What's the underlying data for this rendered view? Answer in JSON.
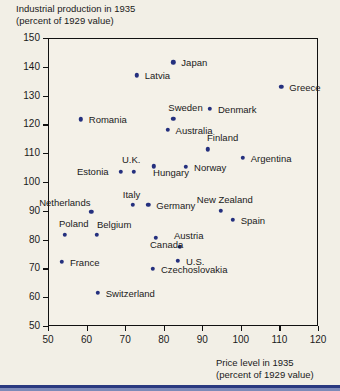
{
  "chart_data": {
    "type": "scatter",
    "title": "Industrial production in 1935\n(percent of 1929 value)",
    "ylabel": "Industrial production in 1935 (percent of 1929 value)",
    "xlabel": "Price level in 1935\n(percent of 1929 value)",
    "xlabel_line1": "Price level in 1935",
    "xlabel_line2": "(percent of 1929 value)",
    "title_line1": "Industrial production in 1935",
    "title_line2": "(percent of 1929 value)",
    "xlim": [
      50,
      120
    ],
    "ylim": [
      50,
      150
    ],
    "xticks": [
      50,
      60,
      70,
      80,
      90,
      100,
      110,
      120
    ],
    "yticks": [
      50,
      60,
      70,
      80,
      90,
      100,
      110,
      120,
      130,
      140,
      150
    ],
    "grid": false,
    "legend": "none",
    "point_color": "#24307e",
    "points": [
      {
        "label": "Japan",
        "x": 82.5,
        "y": 141.5,
        "lx": 8,
        "ly": -4
      },
      {
        "label": "Latvia",
        "x": 73.0,
        "y": 137.0,
        "lx": 8,
        "ly": -4
      },
      {
        "label": "Greece",
        "x": 110.5,
        "y": 133.0,
        "lx": 8,
        "ly": -4
      },
      {
        "label": "Denmark",
        "x": 92.0,
        "y": 125.5,
        "lx": 8,
        "ly": -4
      },
      {
        "label": "Sweden",
        "x": 82.5,
        "y": 122.0,
        "lx": -5,
        "ly": -16
      },
      {
        "label": "Romania",
        "x": 58.5,
        "y": 121.8,
        "lx": 8,
        "ly": -4
      },
      {
        "label": "Australia",
        "x": 81.0,
        "y": 118.2,
        "lx": 8,
        "ly": -4
      },
      {
        "label": "Finland",
        "x": 91.5,
        "y": 111.3,
        "lx": -1,
        "ly": -16
      },
      {
        "label": "Argentina",
        "x": 100.5,
        "y": 108.5,
        "lx": 8,
        "ly": -4
      },
      {
        "label": "Norway",
        "x": 85.8,
        "y": 105.2,
        "lx": 8,
        "ly": -4
      },
      {
        "label": "Hungary",
        "x": 77.5,
        "y": 105.5,
        "lx": -1,
        "ly": 2
      },
      {
        "label": "U.K.",
        "x": 72.3,
        "y": 103.5,
        "lx": -12,
        "ly": -17
      },
      {
        "label": "Estonia",
        "x": 68.9,
        "y": 103.5,
        "lx": -44,
        "ly": -5
      },
      {
        "label": "Germany",
        "x": 76.0,
        "y": 92.0,
        "lx": 8,
        "ly": -4
      },
      {
        "label": "Italy",
        "x": 72.0,
        "y": 92.0,
        "lx": -10,
        "ly": -15
      },
      {
        "label": "New Zealand",
        "x": 94.8,
        "y": 90.0,
        "lx": -24,
        "ly": -16
      },
      {
        "label": "Netherlands",
        "x": 61.2,
        "y": 89.6,
        "lx": -52,
        "ly": -14
      },
      {
        "label": "Spain",
        "x": 97.9,
        "y": 86.8,
        "lx": 8,
        "ly": -4
      },
      {
        "label": "Poland",
        "x": 54.4,
        "y": 81.6,
        "lx": -6,
        "ly": -16
      },
      {
        "label": "Belgium",
        "x": 62.7,
        "y": 81.6,
        "lx": 0,
        "ly": -15
      },
      {
        "label": "Austria",
        "x": 84.2,
        "y": 77.4,
        "lx": -6,
        "ly": -16
      },
      {
        "label": "Canada",
        "x": 78.0,
        "y": 80.6,
        "lx": -6,
        "ly": 2
      },
      {
        "label": "U.S.",
        "x": 83.7,
        "y": 72.6,
        "lx": 8,
        "ly": -4
      },
      {
        "label": "France",
        "x": 53.6,
        "y": 72.2,
        "lx": 8,
        "ly": -4
      },
      {
        "label": "Czechoslovakia",
        "x": 77.2,
        "y": 69.8,
        "lx": 8,
        "ly": -4
      },
      {
        "label": "Switzerland",
        "x": 62.9,
        "y": 61.5,
        "lx": 8,
        "ly": -4
      }
    ]
  }
}
